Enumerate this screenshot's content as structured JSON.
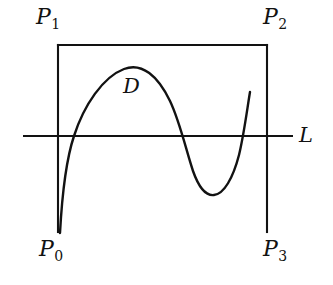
{
  "figure": {
    "width": 333,
    "height": 285,
    "background_color": "#ffffff",
    "ink_color": "#121212"
  },
  "labels": {
    "p0": {
      "base": "P",
      "sub": "0",
      "text": "P0",
      "x": 39,
      "y": 238
    },
    "p1": {
      "base": "P",
      "sub": "1",
      "text": "P1",
      "x": 36,
      "y": 6
    },
    "p2": {
      "base": "P",
      "sub": "2",
      "text": "P2",
      "x": 263,
      "y": 6
    },
    "p3": {
      "base": "P",
      "sub": "3",
      "text": "P3",
      "x": 263,
      "y": 238
    },
    "curve": {
      "text": "D",
      "x": 123,
      "y": 76
    },
    "line": {
      "text": "L",
      "x": 299,
      "y": 125
    }
  },
  "geometry": {
    "control_polygon": {
      "name": "control-polygon",
      "description": "Open polyline P0 -> P1 -> P2 -> P3 drawn as three straight segments",
      "points": [
        {
          "name": "P0",
          "x": 58,
          "y": 232
        },
        {
          "name": "P1",
          "x": 58,
          "y": 45
        },
        {
          "name": "P2",
          "x": 267,
          "y": 45
        },
        {
          "name": "P3",
          "x": 267,
          "y": 232
        }
      ],
      "stroke_width": 2.1
    },
    "line_L": {
      "name": "horizontal-line-L",
      "y": 136,
      "x_start": 23,
      "x_end": 293,
      "stroke_width": 2.1
    },
    "curve_D": {
      "name": "cubic-bezier-curve-D",
      "stroke_width": 2.4,
      "start": {
        "x": 60,
        "y": 233
      },
      "end": {
        "x": 250,
        "y": 92
      },
      "peak": {
        "x": 130,
        "y": 68
      },
      "valley": {
        "x": 210,
        "y": 195
      },
      "path": "M 60 233 C 62 196 66 160 74 136 C 84 105 103 77 124 69 C 142 62 158 76 170 101 C 180 122 186 150 193 171 C 199 188 206 196 214 195 C 224 194 233 178 239 155 C 244 134 247 110 250 92",
      "crossings_with_L": [
        {
          "name": "crossing-left",
          "x": 73,
          "y": 136
        },
        {
          "name": "crossing-middle",
          "x": 177,
          "y": 136
        },
        {
          "name": "crossing-right",
          "x": 248,
          "y": 136
        }
      ]
    }
  }
}
